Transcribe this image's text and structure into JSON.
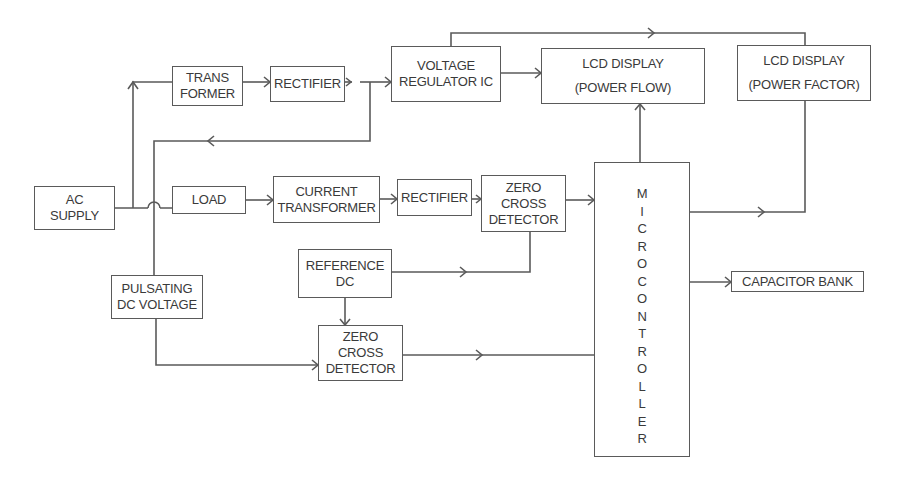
{
  "diagram": {
    "type": "block-diagram",
    "colors": {
      "line": "#5a5a5a",
      "text": "#3a3a3a",
      "background": "#ffffff"
    },
    "blocks": {
      "ac_supply": [
        "AC",
        "SUPPLY"
      ],
      "transformer": [
        "TRANS",
        "FORMER"
      ],
      "rectifier_top": [
        "RECTIFIER"
      ],
      "voltage_regulator": [
        "VOLTAGE",
        "REGULATOR IC"
      ],
      "lcd_power_flow": [
        "LCD DISPLAY",
        "(POWER FLOW)"
      ],
      "lcd_power_factor": [
        "LCD DISPLAY",
        "(POWER FACTOR)"
      ],
      "load": [
        "LOAD"
      ],
      "current_transformer": [
        "CURRENT",
        "TRANSFORMER"
      ],
      "rectifier_mid": [
        "RECTIFIER"
      ],
      "zcd_top": [
        "ZERO",
        "CROSS",
        "DETECTOR"
      ],
      "microcontroller": [
        "M",
        "I",
        "C",
        "R",
        "O",
        "C",
        "O",
        "N",
        "T",
        "R",
        "O",
        "L",
        "L",
        "E",
        "R"
      ],
      "reference_dc": [
        "REFERENCE",
        "DC"
      ],
      "pulsating_dc": [
        "PULSATING",
        "DC VOLTAGE"
      ],
      "zcd_bottom": [
        "ZERO",
        "CROSS",
        "DETECTOR"
      ],
      "capacitor_bank": [
        "CAPACITOR BANK"
      ]
    },
    "connections": [
      [
        "AC SUPPLY",
        "TRANS FORMER"
      ],
      [
        "AC SUPPLY",
        "LOAD"
      ],
      [
        "TRANS FORMER",
        "RECTIFIER"
      ],
      [
        "RECTIFIER",
        "VOLTAGE REGULATOR IC"
      ],
      [
        "RECTIFIER",
        "PULSATING DC VOLTAGE"
      ],
      [
        "VOLTAGE REGULATOR IC",
        "LCD DISPLAY (POWER FLOW)"
      ],
      [
        "VOLTAGE REGULATOR IC",
        "LCD DISPLAY (POWER FACTOR)"
      ],
      [
        "LOAD",
        "CURRENT TRANSFORMER"
      ],
      [
        "CURRENT TRANSFORMER",
        "RECTIFIER"
      ],
      [
        "RECTIFIER",
        "ZERO CROSS DETECTOR"
      ],
      [
        "ZERO CROSS DETECTOR",
        "MICROCONTROLLER"
      ],
      [
        "REFERENCE DC",
        "ZERO CROSS DETECTOR (top)"
      ],
      [
        "REFERENCE DC",
        "ZERO CROSS DETECTOR (bottom)"
      ],
      [
        "PULSATING DC VOLTAGE",
        "ZERO CROSS DETECTOR (bottom)"
      ],
      [
        "ZERO CROSS DETECTOR (bottom)",
        "MICROCONTROLLER"
      ],
      [
        "MICROCONTROLLER",
        "LCD DISPLAY (POWER FLOW)"
      ],
      [
        "MICROCONTROLLER",
        "LCD DISPLAY (POWER FACTOR)"
      ],
      [
        "MICROCONTROLLER",
        "CAPACITOR BANK"
      ]
    ]
  }
}
